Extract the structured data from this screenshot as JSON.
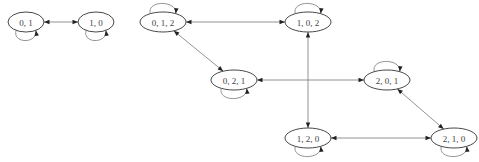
{
  "diagram": {
    "type": "state-transition-graph",
    "nodes": [
      {
        "id": "n01",
        "label": "0, 1",
        "loop": "below"
      },
      {
        "id": "n10",
        "label": "1, 0",
        "loop": "below"
      },
      {
        "id": "n012",
        "label": "0, 1, 2",
        "loop": "above"
      },
      {
        "id": "n102",
        "label": "1, 0, 2",
        "loop": "above"
      },
      {
        "id": "n021",
        "label": "0, 2, 1",
        "loop": "below"
      },
      {
        "id": "n201",
        "label": "2, 0, 1",
        "loop": "above"
      },
      {
        "id": "n120",
        "label": "1, 2, 0",
        "loop": "below"
      },
      {
        "id": "n210",
        "label": "2, 1, 0",
        "loop": "below"
      }
    ],
    "edges": [
      {
        "from": "n01",
        "to": "n10",
        "bidirectional": true
      },
      {
        "from": "n012",
        "to": "n102",
        "bidirectional": true
      },
      {
        "from": "n012",
        "to": "n021",
        "bidirectional": true
      },
      {
        "from": "n102",
        "to": "n120",
        "bidirectional": true
      },
      {
        "from": "n021",
        "to": "n201",
        "bidirectional": true
      },
      {
        "from": "n201",
        "to": "n210",
        "bidirectional": true
      },
      {
        "from": "n120",
        "to": "n210",
        "bidirectional": true
      }
    ],
    "colors": {
      "node_stroke": "#333333",
      "edge": "#777777",
      "arrowhead": "#222222",
      "label": "#444444",
      "background": "#ffffff"
    }
  }
}
